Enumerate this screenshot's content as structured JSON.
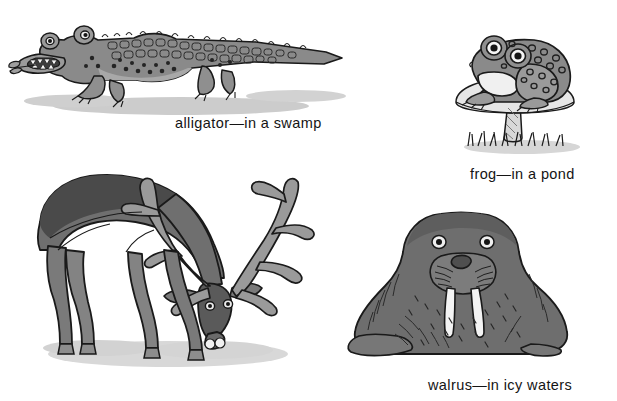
{
  "page": {
    "background_color": "#ffffff"
  },
  "palette": {
    "ink": "#1a1a1a",
    "body_mid": "#8a8a8a",
    "body_dark": "#4a4a4a",
    "body_light": "#b5b5b5",
    "belly_white": "#f2f2f2",
    "shadow": "#c9c9c9",
    "caption_color": "#141414"
  },
  "figures": [
    {
      "id": "alligator",
      "animal": "alligator",
      "habitat": "in a swamp",
      "caption": "alligator—in a swamp",
      "description": "cartoon alligator walking left with a leafy twig in its toothy mouth, scaly plated back and spotted flank, cast shadow beneath",
      "fill": "#8a8a8a"
    },
    {
      "id": "frog",
      "animal": "frog",
      "habitat": "in a pond",
      "caption": "frog—in a pond",
      "description": "spotted frog with large round eyes perched on a mushroom, tufts of grass at the base",
      "fill": "#8a8a8a"
    },
    {
      "id": "deer",
      "animal": "caribou",
      "habitat": "",
      "caption": "",
      "description": "grazing caribou with large branching antlers, head lowered to the ground, dark back and lighter legs, cast shadow beneath",
      "fill": "#6f6f6f"
    },
    {
      "id": "walrus",
      "animal": "walrus",
      "habitat": "in icy waters",
      "caption": "walrus—in icy waters",
      "description": "walrus sitting upright with two long white tusks, whiskered muzzle, round eyes and flippers",
      "fill": "#6e6e6e"
    }
  ],
  "captions": {
    "alligator": "alligator—in a swamp",
    "frog": "frog—in a pond",
    "walrus": "walrus—in icy waters"
  }
}
